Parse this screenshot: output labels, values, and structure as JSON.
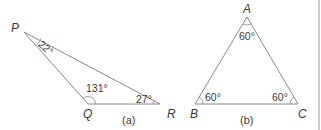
{
  "figure_a": {
    "caption": "(a)",
    "vertices": {
      "P": "P",
      "Q": "Q",
      "R": "R"
    },
    "angles": {
      "P": "22°",
      "Q": "131°",
      "R": "27°"
    }
  },
  "figure_b": {
    "caption": "(b)",
    "vertices": {
      "A": "A",
      "B": "B",
      "C": "C"
    },
    "angles": {
      "A": "60°",
      "B": "60°",
      "C": "60°"
    }
  },
  "colors": {
    "line": "#8a8a8a",
    "text": "#3a3a3a",
    "border": "#9a9a9a"
  }
}
